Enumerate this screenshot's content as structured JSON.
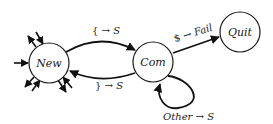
{
  "diagram": {
    "type": "state-machine",
    "states": [
      {
        "id": "new",
        "label": "New"
      },
      {
        "id": "com",
        "label": "Com"
      },
      {
        "id": "quit",
        "label": "Quit"
      }
    ],
    "transitions": [
      {
        "from": "new",
        "to": "com",
        "label_prefix": "{",
        "label_arrow": "→",
        "label_target": "S"
      },
      {
        "from": "com",
        "to": "new",
        "label_prefix": "}",
        "label_arrow": "→",
        "label_target": "S"
      },
      {
        "from": "com",
        "to": "quit",
        "label_prefix": "$",
        "label_arrow": "→",
        "label_target": "Fail"
      },
      {
        "from": "com",
        "to": "com",
        "label_prefix": "Other",
        "label_arrow": "→",
        "label_target": "S"
      }
    ],
    "new_state_stubs": "multiple incoming/outgoing arrows around New"
  }
}
